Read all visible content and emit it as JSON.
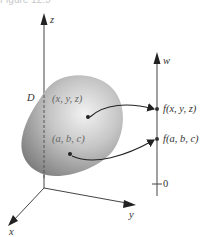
{
  "caption": "Figure 12.5",
  "axes3d": {
    "z_label": "z",
    "y_label": "y",
    "x_label": "x"
  },
  "region": {
    "label": "D",
    "point1_label": "(x, y, z)",
    "point2_label": "(a, b, c)"
  },
  "w_axis": {
    "label": "w",
    "value1_label": "f(x, y, z)",
    "value2_label": "f(a, b, c)",
    "zero_label": "0"
  },
  "colors": {
    "axis": "#444444",
    "blob_light": "#e8e8e8",
    "blob_dark": "#8a8a8a",
    "text": "#333333"
  }
}
